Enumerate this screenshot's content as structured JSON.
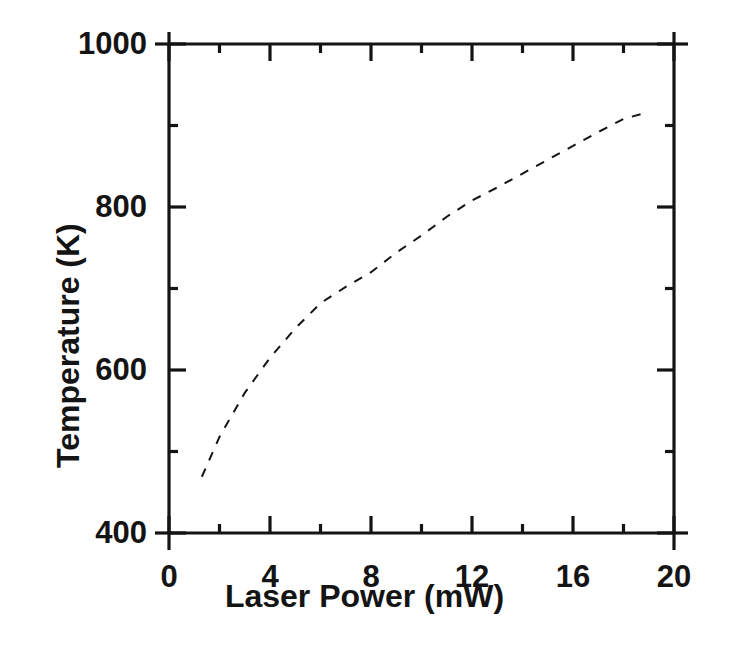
{
  "figure": {
    "background_color": "#ffffff",
    "ink_color": "#141414"
  },
  "chart_data": {
    "type": "line",
    "title": "",
    "subtitle": "",
    "xlabel": "Laser Power (mW)",
    "ylabel": "Temperature (K)",
    "xlim": [
      0,
      20
    ],
    "ylim": [
      400,
      1000
    ],
    "xticks": [
      0,
      4,
      8,
      12,
      16,
      20
    ],
    "xtick_labels": [
      "0",
      "4",
      "8",
      "12",
      "16",
      "20"
    ],
    "xminor_ticks": [
      2,
      6,
      10,
      14,
      18
    ],
    "yticks": [
      400,
      600,
      800,
      1000
    ],
    "ytick_labels": [
      "400",
      "600",
      "800",
      "1000"
    ],
    "yminor_ticks": [
      500,
      700,
      900
    ],
    "grid": false,
    "legend": null,
    "annotations": [],
    "series": [
      {
        "name": "Calculated temperature",
        "style": "dashed",
        "color": "#141414",
        "linewidth": 2,
        "dash_pattern": "9 9",
        "x": [
          1.3,
          2.0,
          3.0,
          4.0,
          5.0,
          6.0,
          7.0,
          8.0,
          9.0,
          10.0,
          11.0,
          12.0,
          13.0,
          14.0,
          15.0,
          16.0,
          17.0,
          18.0,
          18.8
        ],
        "y": [
          469,
          518,
          572,
          615,
          651,
          682,
          702,
          720,
          744,
          765,
          788,
          808,
          824,
          841,
          858,
          875,
          892,
          908,
          915
        ]
      }
    ]
  }
}
